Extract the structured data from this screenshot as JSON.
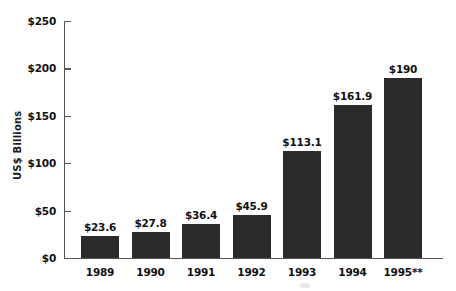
{
  "chart_data": {
    "type": "bar",
    "title": "",
    "subtitle": "",
    "xlabel": "",
    "ylabel": "US$ Billions",
    "categories": [
      "1989",
      "1990",
      "1991",
      "1992",
      "1993",
      "1994",
      "1995**"
    ],
    "values": [
      23.6,
      27.8,
      36.4,
      45.9,
      113.1,
      161.9,
      190
    ],
    "data_labels": [
      "$23.6",
      "$27.8",
      "$36.4",
      "$45.9",
      "$113.1",
      "$161.9",
      "$190"
    ],
    "ylim": [
      0,
      250
    ],
    "ytick_values": [
      0,
      50,
      100,
      150,
      200,
      250
    ],
    "ytick_labels": [
      "$0",
      "$50",
      "$100",
      "$150",
      "$200",
      "$250"
    ],
    "grid": false,
    "legend": null,
    "bar_color": "#2b2b2b",
    "axis_color": "#555555",
    "background_color": "#ffffff",
    "text_color": "#111111"
  }
}
